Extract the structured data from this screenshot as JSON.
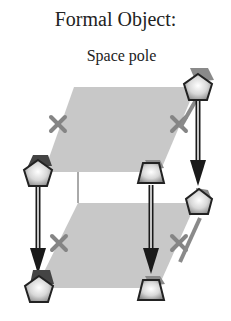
{
  "figure": {
    "title": "Formal Object:",
    "subtitle": "Space pole",
    "colors": {
      "plane": "#c8c8c8",
      "cross": "#8a8a8a",
      "arrow": "#1a1a1a",
      "node_fill_light": "#ffffff",
      "node_fill_dark": "#9a9a9a",
      "node_cap": "#6a6a6a"
    },
    "planes": [
      {
        "name": "top-plane"
      },
      {
        "name": "bottom-plane"
      }
    ],
    "nodes": [
      {
        "name": "top-left-pentagon",
        "shape": "pentagon"
      },
      {
        "name": "top-front-trapezoid",
        "shape": "trapezoid"
      },
      {
        "name": "top-back-pentagon",
        "shape": "pentagon"
      },
      {
        "name": "bottom-left-pentagon",
        "shape": "pentagon"
      },
      {
        "name": "bottom-front-trapezoid",
        "shape": "trapezoid"
      },
      {
        "name": "bottom-back-pentagon",
        "shape": "pentagon"
      }
    ],
    "arrows": [
      {
        "from": "top-left-pentagon",
        "to": "bottom-left-pentagon"
      },
      {
        "from": "top-front-trapezoid",
        "to": "bottom-front-trapezoid"
      },
      {
        "from": "top-back-pentagon",
        "to": "bottom-back-pentagon"
      }
    ],
    "cross_marks": 4
  }
}
